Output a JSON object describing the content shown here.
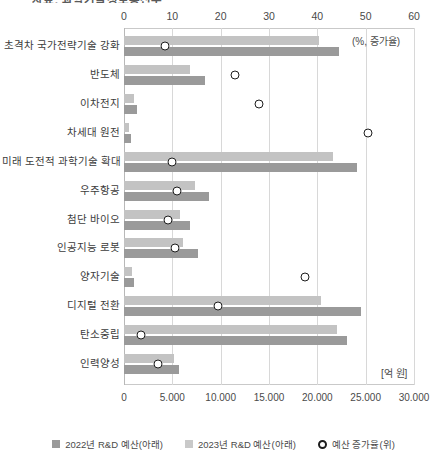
{
  "title_partial": "자료: 과학기술정보통신부",
  "chart_data": {
    "type": "bar",
    "orientation": "horizontal",
    "title": "",
    "xlabel_top": "(%, 증가율)",
    "xlabel_bottom": "[억 원]",
    "grid": true,
    "legend_position": "bottom",
    "top_axis": {
      "label": "(%, 증가율)",
      "ticks": [
        "0",
        "10",
        "20",
        "30",
        "40",
        "50",
        "60"
      ],
      "values": [
        0,
        10,
        20,
        30,
        40,
        50,
        60
      ],
      "xlim": [
        0,
        60
      ]
    },
    "bottom_axis": {
      "label": "[억 원]",
      "ticks": [
        "0",
        "5.000",
        "10.000",
        "15.000",
        "20.000",
        "25.000",
        "30.000"
      ],
      "values": [
        0,
        5000,
        10000,
        15000,
        20000,
        25000,
        30000
      ],
      "xlim": [
        0,
        30000
      ]
    },
    "categories": [
      "초격차 국가전략기술 강화",
      "반도체",
      "이차전지",
      "차세대 원전",
      "미래 도전적 과학기술 확대",
      "우주항공",
      "첨단 바이오",
      "인공지능 로봇",
      "양자기술",
      "디지털 전환",
      "탄소중립",
      "인력양성"
    ],
    "series": [
      {
        "name": "2022년 R&D 예산(아래)",
        "color": "#c3c3c3",
        "axis": "bottom",
        "unit": "억 원",
        "values": [
          20200,
          6800,
          1000,
          550,
          21600,
          7300,
          5800,
          6100,
          800,
          20400,
          22000,
          5200
        ]
      },
      {
        "name": "2023년 R&D 예산(아래)",
        "color": "#9a9a9a",
        "axis": "bottom",
        "unit": "억 원",
        "values": [
          22200,
          8400,
          1300,
          700,
          24100,
          8800,
          6800,
          7700,
          1000,
          24500,
          23100,
          5700
        ]
      },
      {
        "name": "예산 증가율(위)",
        "color": "#1d1d1d",
        "type": "scatter",
        "marker": "open-circle",
        "axis": "top",
        "unit": "%",
        "values": [
          8.5,
          23.0,
          28.0,
          50.5,
          10.0,
          11.0,
          9.0,
          10.5,
          37.5,
          19.5,
          3.5,
          7.0
        ]
      }
    ]
  },
  "legend": {
    "items": [
      {
        "label": "2022년 R&D 예산(아래)",
        "swatch": "square",
        "color": "#9a9a9a"
      },
      {
        "label": "2023년 R&D 예산(아래)",
        "swatch": "square",
        "color": "#c9c9c9"
      },
      {
        "label": "예산 증가율(위)",
        "swatch": "circle",
        "color": "#1d1d1d"
      }
    ]
  }
}
